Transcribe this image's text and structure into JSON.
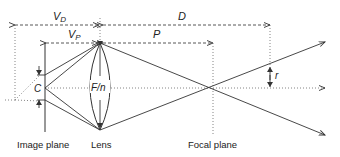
{
  "diagram": {
    "type": "optics-ray-diagram",
    "labels": {
      "vd": "V",
      "vd_sub": "D",
      "d": "D",
      "vp": "V",
      "vp_sub": "P",
      "p": "P",
      "c": "C",
      "fn": "F/n",
      "r": "r"
    },
    "planes": {
      "image_plane": "Image plane",
      "lens": "Lens",
      "focal_plane": "Focal plane"
    },
    "colors": {
      "line": "#333333",
      "background": "#ffffff"
    }
  }
}
